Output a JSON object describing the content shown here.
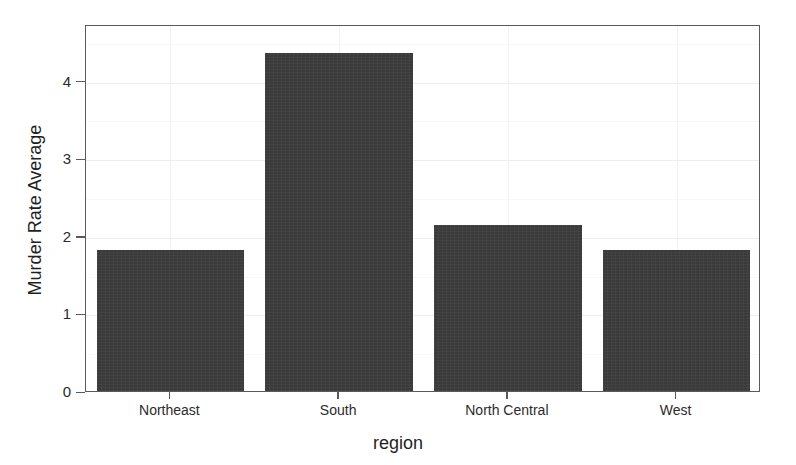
{
  "chart_data": {
    "type": "bar",
    "title": "",
    "subtitle": "",
    "xlabel": "region",
    "ylabel": "Murder Rate Average",
    "categories": [
      "Northeast",
      "South",
      "North Central",
      "West"
    ],
    "values": [
      1.82,
      4.36,
      2.14,
      1.82
    ],
    "series": [
      {
        "name": "Murder Rate Average",
        "values": [
          1.82,
          4.36,
          2.14,
          1.82
        ]
      }
    ],
    "ylim": [
      0,
      4.73
    ],
    "xlim": [
      0,
      4
    ],
    "yticks": [
      0,
      1,
      2,
      3,
      4
    ],
    "ytick_labels": [
      "0",
      "1",
      "2",
      "3",
      "4"
    ],
    "xtick_labels": [
      "Northeast",
      "South",
      "North Central",
      "West"
    ],
    "grid": true,
    "grid_minor": true,
    "legend": false,
    "legend_position": "none",
    "bar_color": "#3a3a3a",
    "background_color": "#ffffff",
    "axis_color": "#5a5a5a",
    "grid_color": "#f0f0f0"
  },
  "axes": {
    "y_ticks": [
      {
        "label": "4",
        "value": 4
      },
      {
        "label": "3",
        "value": 3
      },
      {
        "label": "2",
        "value": 2
      },
      {
        "label": "1",
        "value": 1
      },
      {
        "label": "0",
        "value": 0
      }
    ],
    "x_ticks": [
      {
        "label": "Northeast"
      },
      {
        "label": "South"
      },
      {
        "label": "North Central"
      },
      {
        "label": "West"
      }
    ]
  }
}
